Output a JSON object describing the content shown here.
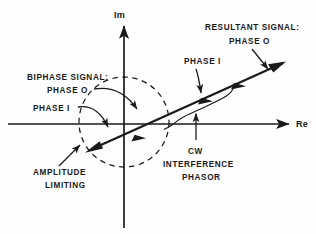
{
  "diagram": {
    "background_color": "#fefefe",
    "ink_color": "#1a1a1a"
  },
  "axes": {
    "imaginary": {
      "label": "Im",
      "orientation": "vertical",
      "arrow": "up"
    },
    "real": {
      "label": "Re",
      "orientation": "horizontal",
      "arrow": "right"
    },
    "origin": {
      "x": 124,
      "y": 124
    }
  },
  "labels": {
    "resultant": {
      "line1": "RESULTANT SIGNAL:",
      "line2": "PHASE O"
    },
    "phase_one_main": "PHASE I",
    "biphase": {
      "line1": "BIPHASE SIGNAL:",
      "line2": "PHASE O",
      "line3": "PHASE I"
    },
    "amplitude": {
      "line1": "AMPLITUDE",
      "line2": "LIMITING"
    },
    "cw": {
      "line1": "CW",
      "line2": "INTERFERENCE",
      "line3": "PHASOR"
    }
  },
  "elements": {
    "amplitude_circle": {
      "style": "dashed",
      "center_x": 124,
      "center_y": 122,
      "radius": 45
    },
    "main_phasor": {
      "from_x": 85,
      "from_y": 152,
      "to_x": 287,
      "to_y": 61,
      "bidirectional": true
    },
    "cw_brace": {
      "description": "thin brace under right segment of main phasor"
    }
  }
}
